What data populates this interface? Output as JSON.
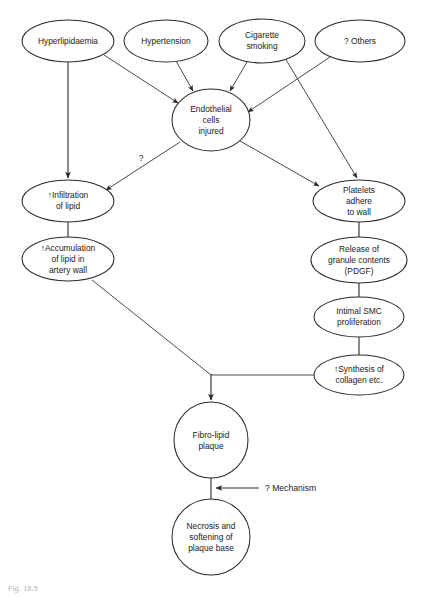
{
  "diagram": {
    "caption": "Fig. 18.5",
    "background_color": "#ffffff",
    "stroke_color": "#2b2b2b",
    "text_color": "#1a1a1a",
    "nodes": [
      {
        "id": "hyperlipidaemia",
        "label": "Hyperlipidaemia",
        "shape": "ellipse",
        "cx": 68,
        "cy": 41,
        "rx": 46,
        "ry": 21,
        "lines": [
          "Hyperlipidaemia"
        ]
      },
      {
        "id": "hypertension",
        "label": "Hypertension",
        "shape": "ellipse",
        "cx": 166,
        "cy": 41,
        "rx": 42,
        "ry": 21,
        "lines": [
          "Hypertension"
        ]
      },
      {
        "id": "cigarette-smoking",
        "label": "Cigarette smoking",
        "shape": "ellipse",
        "cx": 262,
        "cy": 41,
        "rx": 43,
        "ry": 22,
        "lines": [
          "Cigarette",
          "smoking"
        ]
      },
      {
        "id": "others",
        "label": "? Others",
        "shape": "ellipse",
        "cx": 360,
        "cy": 41,
        "rx": 45,
        "ry": 21,
        "lines": [
          "? Others"
        ]
      },
      {
        "id": "endothelial-cells-injured",
        "label": "Endothelial cells injured",
        "shape": "circle",
        "cx": 211,
        "cy": 120,
        "rx": 39,
        "ry": 31,
        "lines": [
          "Endothelial",
          "cells",
          "injured"
        ]
      },
      {
        "id": "infiltration-of-lipid",
        "label": "↑Infiltration of lipid",
        "shape": "ellipse",
        "cx": 68,
        "cy": 201,
        "rx": 46,
        "ry": 21,
        "lines": [
          "↑Infiltration",
          "of lipid"
        ]
      },
      {
        "id": "accumulation-of-lipid",
        "label": "↑Accumulation of lipid in artery wall",
        "shape": "ellipse",
        "cx": 68,
        "cy": 259,
        "rx": 46,
        "ry": 22,
        "lines": [
          "↑Accumulation",
          "of lipid in",
          "artery wall"
        ]
      },
      {
        "id": "platelets-adhere-to-wall",
        "label": "Platelets adhere to wall",
        "shape": "ellipse",
        "cx": 359,
        "cy": 201,
        "rx": 46,
        "ry": 21,
        "lines": [
          "Platelets",
          "adhere",
          "to wall"
        ]
      },
      {
        "id": "release-of-granule-contents",
        "label": "Release of granule contents (PDGF)",
        "shape": "ellipse",
        "cx": 359,
        "cy": 260,
        "rx": 48,
        "ry": 23,
        "lines": [
          "Release of",
          "granule contents",
          "(PDGF)"
        ]
      },
      {
        "id": "intimal-smc-proliferation",
        "label": "Intimal SMC proliferation",
        "shape": "ellipse",
        "cx": 359,
        "cy": 317,
        "rx": 45,
        "ry": 20,
        "lines": [
          "Intimal SMC",
          "proliferation"
        ]
      },
      {
        "id": "synthesis-of-collagen",
        "label": "↑Synthesis of collagen etc.",
        "shape": "ellipse",
        "cx": 359,
        "cy": 375,
        "rx": 45,
        "ry": 20,
        "lines": [
          "↑Synthesis of",
          "collagen etc."
        ]
      },
      {
        "id": "fibro-lipid-plaque",
        "label": "Fibro-lipid plaque",
        "shape": "circle",
        "cx": 211,
        "cy": 440,
        "rx": 37,
        "ry": 38,
        "lines": [
          "Fibro-lipid",
          "plaque"
        ]
      },
      {
        "id": "necrosis-and-softening",
        "label": "Necrosis and softening of plaque base",
        "shape": "circle",
        "cx": 211,
        "cy": 537,
        "rx": 39,
        "ry": 38,
        "lines": [
          "Necrosis and",
          "softening of",
          "plaque base"
        ]
      }
    ],
    "edge_labels": [
      {
        "id": "question-mark",
        "text": "?",
        "x": 141,
        "y": 158
      },
      {
        "id": "mechanism",
        "text": "? Mechanism",
        "x": 265,
        "y": 491
      }
    ],
    "edges": [
      {
        "id": "hyperlipidaemia-to-infiltration",
        "from": "hyperlipidaemia",
        "to": "infiltration-of-lipid"
      },
      {
        "id": "hyperlipidaemia-to-endothelial",
        "from": "hyperlipidaemia",
        "to": "endothelial-cells-injured"
      },
      {
        "id": "hypertension-to-endothelial",
        "from": "hypertension",
        "to": "endothelial-cells-injured"
      },
      {
        "id": "cigarette-to-endothelial",
        "from": "cigarette-smoking",
        "to": "endothelial-cells-injured"
      },
      {
        "id": "cigarette-to-platelets",
        "from": "cigarette-smoking",
        "to": "platelets-adhere-to-wall"
      },
      {
        "id": "others-to-endothelial",
        "from": "others",
        "to": "endothelial-cells-injured"
      },
      {
        "id": "endothelial-to-infiltration",
        "from": "endothelial-cells-injured",
        "to": "infiltration-of-lipid",
        "label": "?"
      },
      {
        "id": "endothelial-to-platelets",
        "from": "endothelial-cells-injured",
        "to": "platelets-adhere-to-wall"
      },
      {
        "id": "infiltration-to-accumulation",
        "from": "infiltration-of-lipid",
        "to": "accumulation-of-lipid"
      },
      {
        "id": "platelets-to-release",
        "from": "platelets-adhere-to-wall",
        "to": "release-of-granule-contents"
      },
      {
        "id": "release-to-intimal",
        "from": "release-of-granule-contents",
        "to": "intimal-smc-proliferation"
      },
      {
        "id": "intimal-to-synthesis",
        "from": "intimal-smc-proliferation",
        "to": "synthesis-of-collagen"
      },
      {
        "id": "accumulation-to-plaque",
        "from": "accumulation-of-lipid",
        "to": "fibro-lipid-plaque"
      },
      {
        "id": "synthesis-to-plaque",
        "from": "synthesis-of-collagen",
        "to": "fibro-lipid-plaque"
      },
      {
        "id": "plaque-to-necrosis",
        "from": "fibro-lipid-plaque",
        "to": "necrosis-and-softening"
      },
      {
        "id": "mechanism-to-plaque-base",
        "from": "mechanism-label",
        "to": "plaque-to-necrosis",
        "label": "? Mechanism"
      }
    ]
  }
}
